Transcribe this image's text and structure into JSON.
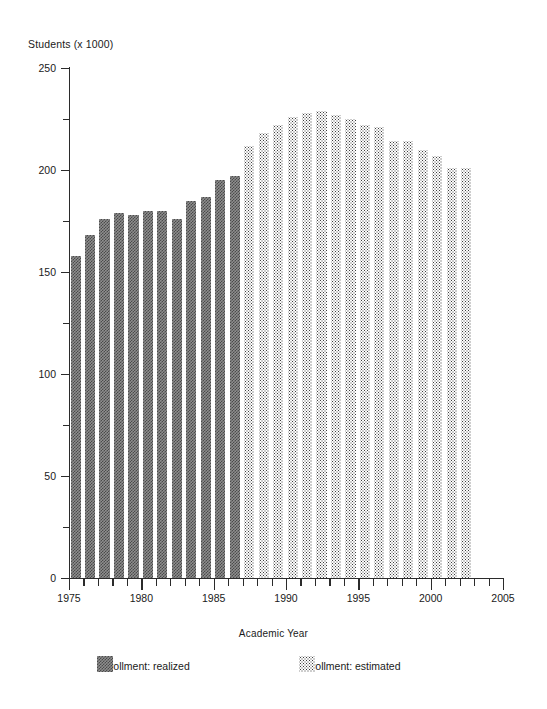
{
  "chart_data": {
    "type": "bar",
    "title": "",
    "ylabel": "Students (x 1000)",
    "xlabel": "Academic Year",
    "ylim": [
      0,
      250
    ],
    "ytick_values": [
      0,
      50,
      100,
      150,
      200,
      250
    ],
    "ytick_labels": [
      "0",
      "50",
      "100",
      "150",
      "200",
      "250"
    ],
    "yminor_ticks": [
      25,
      75,
      125,
      175,
      225
    ],
    "grid": false,
    "legend_position": "bottom",
    "xlim": [
      1975,
      2005
    ],
    "xtick_major_values": [
      1975,
      1980,
      1985,
      1990,
      1995,
      2000,
      2005
    ],
    "xtick_major_labels": [
      "1975",
      "1980",
      "1985",
      "1990",
      "1995",
      "2000",
      "2005"
    ],
    "categories": [
      "1975",
      "1976",
      "1977",
      "1978",
      "1979",
      "1980",
      "1981",
      "1982",
      "1983",
      "1984",
      "1985",
      "1986",
      "1987",
      "1988",
      "1989",
      "1990",
      "1991",
      "1992",
      "1993",
      "1994",
      "1995",
      "1996",
      "1997",
      "1998",
      "1999",
      "2000",
      "2001",
      "2002"
    ],
    "series": [
      {
        "name": "Enrollment: realized",
        "pattern": "dark-checker",
        "values": [
          158,
          168,
          176,
          179,
          178,
          180,
          180,
          176,
          185,
          187,
          195,
          197,
          200,
          null,
          null,
          null,
          null,
          null,
          null,
          null,
          null,
          null,
          null,
          null,
          null,
          null,
          null,
          null
        ]
      },
      {
        "name": "Enrollment: estimated",
        "pattern": "light-dots",
        "values": [
          null,
          null,
          null,
          null,
          null,
          null,
          null,
          null,
          null,
          null,
          null,
          null,
          212,
          218,
          222,
          226,
          228,
          229,
          227,
          225,
          222,
          221,
          214,
          214,
          210,
          207,
          201,
          201
        ]
      }
    ]
  },
  "legend": {
    "items": [
      {
        "label": "Enrollment: realized",
        "pattern": "dark-checker"
      },
      {
        "label": "Enrollment: estimated",
        "pattern": "light-dots"
      }
    ]
  },
  "colors": {
    "axis": "#2b2b2b",
    "realized_fill": "#8e8e8e",
    "realized_pattern": "#4a4a4a",
    "estimated_fill": "#fdfdfd",
    "estimated_pattern": "#3d3d3d",
    "background": "#ffffff"
  }
}
